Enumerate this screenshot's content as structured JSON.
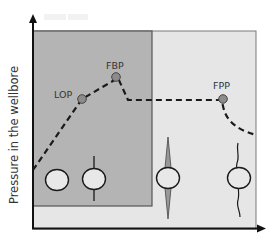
{
  "diagram": {
    "y_axis_label": "Pressure in the wellbore",
    "x_axis_label": "",
    "points": [
      {
        "id": "lop",
        "label": "LOP"
      },
      {
        "id": "fbp",
        "label": "FBP"
      },
      {
        "id": "fpp",
        "label": "FPP"
      }
    ],
    "regions": [
      {
        "id": "early",
        "description": "dark shaded region (before breakdown)"
      },
      {
        "id": "late",
        "description": "light shaded region (propagation)"
      }
    ],
    "borehole_icons": [
      {
        "id": "intact",
        "description": "intact borehole circle"
      },
      {
        "id": "initiated",
        "description": "borehole with thin fracture line"
      },
      {
        "id": "opened",
        "description": "borehole with wide tapered fracture"
      },
      {
        "id": "propagated",
        "description": "borehole with wavy propagated fracture"
      }
    ],
    "colors": {
      "dark_region": "#b4b4b4",
      "light_region": "#e6e6e6",
      "curve": "#1a1a1a",
      "point_fill": "#8c8c8c",
      "axis": "#111111"
    }
  }
}
